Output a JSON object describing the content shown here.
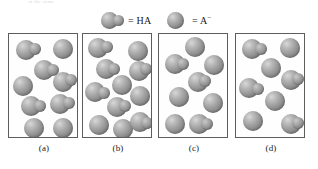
{
  "figure": {
    "top_caption": "of the same",
    "legend": {
      "items": [
        {
          "symbol": "ha",
          "equals": "=",
          "label": "HA",
          "charge": "",
          "glyph": "sphere-with-attached-small-sphere"
        },
        {
          "symbol": "a",
          "equals": "=",
          "label": "A",
          "charge": "−",
          "glyph": "single-sphere"
        }
      ]
    },
    "panels": [
      {
        "id": "a",
        "label": "(a)",
        "molecules": [
          {
            "type": "HA",
            "x": 7,
            "y": 6,
            "r": 10,
            "sub_dx": 13,
            "sub_dy": 3,
            "sub_r": 6
          },
          {
            "type": "A",
            "x": 44,
            "y": 5,
            "r": 10
          },
          {
            "type": "HA",
            "x": 25,
            "y": 26,
            "r": 10,
            "sub_dx": 13,
            "sub_dy": 4,
            "sub_r": 6
          },
          {
            "type": "A",
            "x": 4,
            "y": 42,
            "r": 10
          },
          {
            "type": "HA",
            "x": 44,
            "y": 38,
            "r": 10,
            "sub_dx": 12,
            "sub_dy": 2,
            "sub_r": 6
          },
          {
            "type": "HA",
            "x": 12,
            "y": 62,
            "r": 10,
            "sub_dx": 13,
            "sub_dy": 4,
            "sub_r": 6
          },
          {
            "type": "HA",
            "x": 41,
            "y": 60,
            "r": 10,
            "sub_dx": 13,
            "sub_dy": 3,
            "sub_r": 6
          },
          {
            "type": "A",
            "x": 15,
            "y": 84,
            "r": 10
          },
          {
            "type": "A",
            "x": 44,
            "y": 84,
            "r": 10
          }
        ]
      },
      {
        "id": "b",
        "label": "(b)",
        "molecules": [
          {
            "type": "HA",
            "x": 5,
            "y": 4,
            "r": 10,
            "sub_dx": 13,
            "sub_dy": 3,
            "sub_r": 6
          },
          {
            "type": "A",
            "x": 45,
            "y": 7,
            "r": 10
          },
          {
            "type": "HA",
            "x": 13,
            "y": 25,
            "r": 10,
            "sub_dx": 12,
            "sub_dy": 4,
            "sub_r": 6
          },
          {
            "type": "HA",
            "x": 46,
            "y": 27,
            "r": 10,
            "sub_dx": 11,
            "sub_dy": 2,
            "sub_r": 6
          },
          {
            "type": "A",
            "x": 29,
            "y": 41,
            "r": 10
          },
          {
            "type": "HA",
            "x": 2,
            "y": 48,
            "r": 10,
            "sub_dx": 13,
            "sub_dy": 5,
            "sub_r": 6
          },
          {
            "type": "A",
            "x": 47,
            "y": 52,
            "r": 10
          },
          {
            "type": "HA",
            "x": 24,
            "y": 63,
            "r": 10,
            "sub_dx": 12,
            "sub_dy": 3,
            "sub_r": 6
          },
          {
            "type": "A",
            "x": 6,
            "y": 81,
            "r": 10
          },
          {
            "type": "A",
            "x": 30,
            "y": 85,
            "r": 10
          },
          {
            "type": "HA",
            "x": 47,
            "y": 78,
            "r": 10,
            "sub_dx": 11,
            "sub_dy": 5,
            "sub_r": 6
          }
        ]
      },
      {
        "id": "c",
        "label": "(c)",
        "molecules": [
          {
            "type": "A",
            "x": 26,
            "y": 3,
            "r": 10
          },
          {
            "type": "HA",
            "x": 6,
            "y": 20,
            "r": 10,
            "sub_dx": 12,
            "sub_dy": 4,
            "sub_r": 6
          },
          {
            "type": "A",
            "x": 45,
            "y": 21,
            "r": 10
          },
          {
            "type": "HA",
            "x": 29,
            "y": 38,
            "r": 10,
            "sub_dx": 11,
            "sub_dy": 3,
            "sub_r": 6
          },
          {
            "type": "A",
            "x": 10,
            "y": 53,
            "r": 10
          },
          {
            "type": "A",
            "x": 44,
            "y": 59,
            "r": 10
          },
          {
            "type": "A",
            "x": 6,
            "y": 80,
            "r": 10
          },
          {
            "type": "HA",
            "x": 30,
            "y": 80,
            "r": 10,
            "sub_dx": 12,
            "sub_dy": 4,
            "sub_r": 6
          }
        ]
      },
      {
        "id": "d",
        "label": "(d)",
        "molecules": [
          {
            "type": "HA",
            "x": 6,
            "y": 5,
            "r": 10,
            "sub_dx": 13,
            "sub_dy": 4,
            "sub_r": 6
          },
          {
            "type": "A",
            "x": 44,
            "y": 4,
            "r": 10
          },
          {
            "type": "A",
            "x": 25,
            "y": 24,
            "r": 10
          },
          {
            "type": "HA",
            "x": 45,
            "y": 36,
            "r": 10,
            "sub_dx": 11,
            "sub_dy": 3,
            "sub_r": 6
          },
          {
            "type": "HA",
            "x": 3,
            "y": 44,
            "r": 10,
            "sub_dx": 13,
            "sub_dy": 5,
            "sub_r": 6
          },
          {
            "type": "A",
            "x": 29,
            "y": 57,
            "r": 10
          },
          {
            "type": "A",
            "x": 7,
            "y": 77,
            "r": 10
          },
          {
            "type": "HA",
            "x": 45,
            "y": 80,
            "r": 10,
            "sub_dx": 11,
            "sub_dy": 3,
            "sub_r": 6
          }
        ]
      }
    ],
    "panel_offsets_x": [
      8,
      82,
      158,
      235
    ],
    "colors": {
      "sphere_light": "#d8d8d8",
      "sphere_mid": "#a3a3a3",
      "sphere_dark": "#767676",
      "border": "#5d5d5d",
      "text": "#1a1a1a",
      "background": "#ffffff"
    }
  }
}
